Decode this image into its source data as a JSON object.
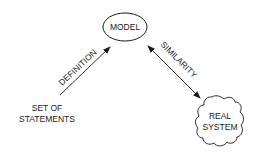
{
  "diagram": {
    "nodes": {
      "model": {
        "label": "MODEL",
        "shape": "ellipse"
      },
      "real_system": {
        "line1": "REAL",
        "line2": "SYSTEM",
        "shape": "cloud"
      },
      "statements": {
        "line1": "SET OF",
        "line2": "STATEMENTS",
        "shape": "none"
      }
    },
    "edges": {
      "definition": {
        "label": "DEFINITION",
        "from": "statements",
        "to": "model",
        "direction": "forward"
      },
      "similarity": {
        "label": "SIMILARITY",
        "from": "model",
        "to": "real_system",
        "direction": "both"
      }
    },
    "colors": {
      "stroke": "#1a1a1a",
      "background": "#ffffff"
    }
  }
}
